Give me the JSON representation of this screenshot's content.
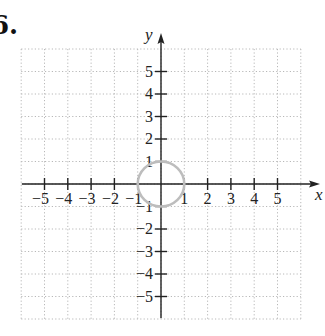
{
  "problem_number": "6.",
  "chart_data": {
    "type": "line",
    "title": "",
    "xlabel": "x",
    "ylabel": "y",
    "xlim": [
      -6,
      6
    ],
    "ylim": [
      -6,
      6
    ],
    "grid": true,
    "grid_style": "dotted",
    "x_ticks": [
      -5,
      -4,
      -3,
      -2,
      -1,
      1,
      2,
      3,
      4,
      5
    ],
    "y_ticks": [
      5,
      4,
      3,
      2,
      1,
      -1,
      -2,
      -3,
      -4,
      -5
    ],
    "series": [
      {
        "name": "circle x^2 + y^2 = 1",
        "shape": "circle",
        "center": [
          0,
          0
        ],
        "radius": 1,
        "color": "#bdbdbd"
      }
    ],
    "legend": null
  },
  "colors": {
    "axis": "#222222",
    "grid": "#b8b8b8",
    "curve": "#bdbdbd",
    "text": "#222222"
  }
}
